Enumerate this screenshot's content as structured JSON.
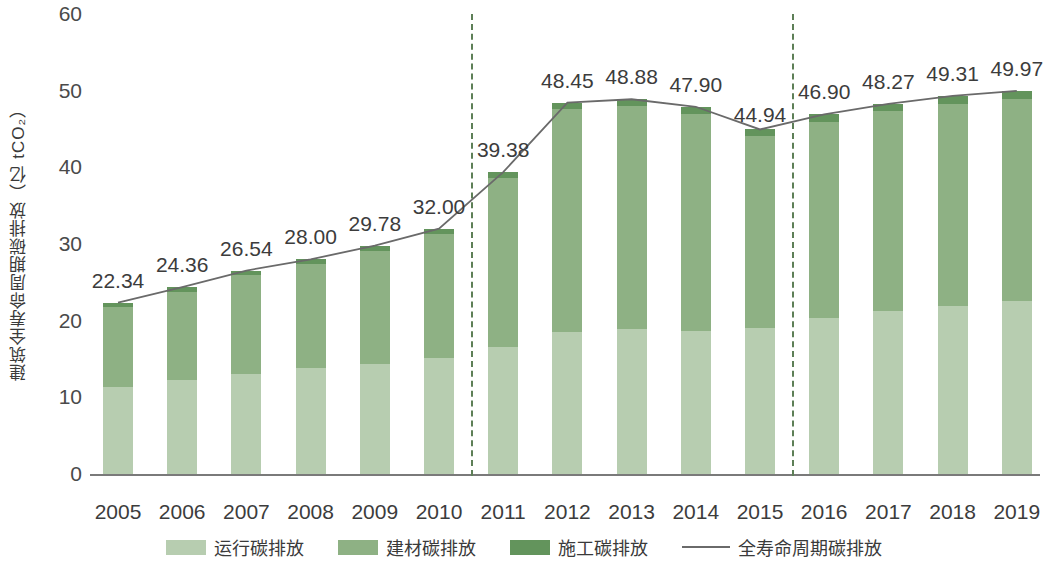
{
  "chart_data": {
    "type": "bar",
    "title": "",
    "xlabel": "",
    "ylabel": "建筑全寿命周期碳排放（亿 tCO₂）",
    "ylim": [
      0,
      60
    ],
    "yticks": [
      0,
      10,
      20,
      30,
      40,
      50,
      60
    ],
    "grid": false,
    "legend_position": "bottom",
    "categories": [
      "2005",
      "2006",
      "2007",
      "2008",
      "2009",
      "2010",
      "2011",
      "2012",
      "2013",
      "2014",
      "2015",
      "2016",
      "2017",
      "2018",
      "2019"
    ],
    "series": [
      {
        "name": "运行碳排放",
        "color": "#b7cdb0",
        "values": [
          11.3,
          12.3,
          13.0,
          13.8,
          14.4,
          15.1,
          16.6,
          18.5,
          18.9,
          18.6,
          19.1,
          20.4,
          21.2,
          21.9,
          22.6
        ]
      },
      {
        "name": "建材碳排放",
        "color": "#8eb184",
        "values": [
          10.5,
          11.4,
          13.0,
          13.6,
          14.7,
          16.2,
          22.0,
          29.1,
          29.1,
          28.4,
          25.0,
          25.5,
          26.1,
          26.4,
          26.3
        ]
      },
      {
        "name": "施工碳排放",
        "color": "#63945c",
        "values": [
          0.54,
          0.66,
          0.54,
          0.6,
          0.68,
          0.7,
          0.78,
          0.85,
          0.88,
          0.9,
          0.84,
          1.0,
          0.97,
          1.01,
          1.07
        ]
      }
    ],
    "line_series": {
      "name": "全寿命周期碳排放",
      "color": "#6a6a6a",
      "values": [
        22.34,
        24.36,
        26.54,
        28.0,
        29.78,
        32.0,
        39.38,
        48.45,
        48.88,
        47.9,
        44.94,
        46.9,
        48.27,
        49.31,
        49.97
      ]
    },
    "data_labels": [
      "22.34",
      "24.36",
      "26.54",
      "28.00",
      "29.78",
      "32.00",
      "39.38",
      "48.45",
      "48.88",
      "47.90",
      "44.94",
      "46.90",
      "48.27",
      "49.31",
      "49.97"
    ],
    "annotations": [
      {
        "type": "vertical-dashed-separator",
        "after_category": "2010",
        "color": "#5d7f57"
      },
      {
        "type": "vertical-dashed-separator",
        "after_category": "2015",
        "color": "#5d7f57"
      }
    ],
    "legend": [
      {
        "label": "运行碳排放",
        "marker": "swatch",
        "color": "#b7cdb0"
      },
      {
        "label": "建材碳排放",
        "marker": "swatch",
        "color": "#8eb184"
      },
      {
        "label": "施工碳排放",
        "marker": "swatch",
        "color": "#63945c"
      },
      {
        "label": "全寿命周期碳排放",
        "marker": "line",
        "color": "#6a6a6a"
      }
    ]
  }
}
